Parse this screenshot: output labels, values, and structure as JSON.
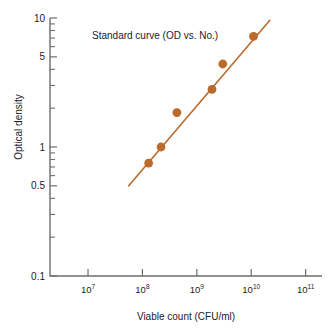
{
  "chart_data": {
    "type": "scatter",
    "title": "Standard curve (OD vs. No.)",
    "xlabel": "Viable count (CFU/ml)",
    "ylabel": "Optical density",
    "xscale": "log",
    "yscale": "log",
    "xlim": [
      2000000,
      200000000000
    ],
    "ylim": [
      0.1,
      10
    ],
    "grid": false,
    "legend": null,
    "accent_color": "#bb6a2b",
    "axis_color": "#6e6e6e",
    "text_color": "#1a1a2e",
    "x_tick_labels": [
      "10",
      "10",
      "10",
      "10",
      "10"
    ],
    "x_tick_exponents": [
      "7",
      "8",
      "9",
      "10",
      "11"
    ],
    "x_tick_values": [
      10000000,
      100000000,
      1000000000,
      10000000000,
      100000000000
    ],
    "y_tick_labels": [
      "10",
      "5",
      "1",
      "0.5",
      "0.1"
    ],
    "y_tick_values": [
      10,
      5,
      1,
      0.5,
      0.1
    ],
    "y_minor_ticks": [
      9,
      8,
      7,
      6,
      4,
      3,
      2,
      0.9,
      0.8,
      0.7,
      0.6,
      0.4,
      0.3,
      0.2
    ],
    "series": [
      {
        "name": "Standard curve",
        "marker": "filled-circle",
        "points": [
          {
            "x": 130000000,
            "y": 0.75
          },
          {
            "x": 220000000,
            "y": 1.0
          },
          {
            "x": 430000000,
            "y": 1.85
          },
          {
            "x": 1900000000,
            "y": 2.8
          },
          {
            "x": 3000000000,
            "y": 4.4
          },
          {
            "x": 11000000000,
            "y": 7.2
          }
        ]
      }
    ],
    "fit_line": {
      "name": "linear-regression-fit",
      "x_start": 56000000,
      "y_start": 0.5,
      "x_end": 22000000000,
      "y_end": 9.6
    }
  }
}
